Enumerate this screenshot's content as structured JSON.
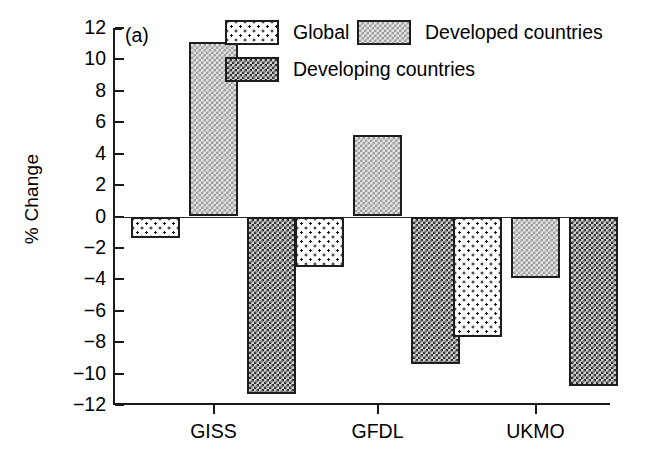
{
  "panel": {
    "label": "(a)"
  },
  "axes": {
    "ylabel": "% Change",
    "ytick_labels": [
      "12",
      "10",
      "8",
      "6",
      "4",
      "2",
      "0",
      "−2",
      "−4",
      "−6",
      "−8",
      "−10",
      "−12"
    ],
    "xtick_labels": [
      "GISS",
      "GFDL",
      "UKMO"
    ]
  },
  "legend": {
    "entries": [
      {
        "label": "Global",
        "pattern": "sparse-dots-on-white",
        "color": "#ffffff"
      },
      {
        "label": "Developed countries",
        "pattern": "fine-light-checker",
        "color": "#c8c8c8"
      },
      {
        "label": "Developing countries",
        "pattern": "fine-dark-checker",
        "color": "#808080"
      }
    ]
  },
  "chart_data": {
    "type": "bar",
    "title": "",
    "xlabel": "",
    "ylabel": "% Change",
    "ylim": [
      -12,
      12
    ],
    "yticks": [
      12,
      10,
      8,
      6,
      4,
      2,
      0,
      -2,
      -4,
      -6,
      -8,
      -10,
      -12
    ],
    "grid": false,
    "legend_position": "top-center",
    "categories": [
      "GISS",
      "GFDL",
      "UKMO"
    ],
    "series": [
      {
        "name": "Global",
        "values": [
          -1.4,
          -3.2,
          -7.7
        ]
      },
      {
        "name": "Developed countries",
        "values": [
          11.1,
          5.2,
          -3.9
        ]
      },
      {
        "name": "Developing countries",
        "values": [
          -11.3,
          -9.4,
          -10.8
        ]
      }
    ]
  }
}
